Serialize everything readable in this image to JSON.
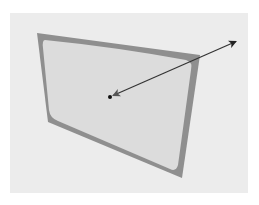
{
  "diagram": {
    "type": "surface-normal-vector",
    "colors": {
      "background": "#ffffff",
      "panel": "#ececec",
      "frame": "#8f8f8f",
      "face": "#dcdcdc",
      "arrow": "#222222",
      "point": "#111111"
    },
    "frame_corners": [
      [
        37,
        33
      ],
      [
        200,
        55
      ],
      [
        182,
        178
      ],
      [
        48,
        122
      ]
    ],
    "center_point": [
      110,
      97
    ],
    "arrow_end": [
      237,
      41
    ],
    "ghost_text": ""
  }
}
